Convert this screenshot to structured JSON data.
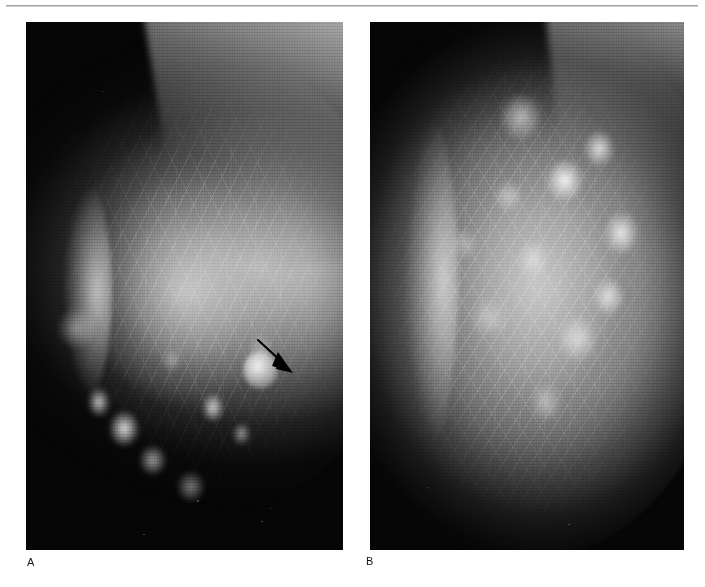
{
  "figure": {
    "kind": "radiology-figure",
    "modality": "mammogram",
    "panel_count": 2,
    "running_head_remnant": "",
    "background_color": "#ffffff",
    "rule_color": "#8f8f8f"
  },
  "panels": [
    {
      "letter": "A",
      "name": "panel-a",
      "view": "mediolateral oblique",
      "background_color": "#000000",
      "annotation": {
        "type": "arrow",
        "color": "#000000",
        "direction": "down-right",
        "tail_x": 262,
        "tail_y": 344,
        "head_x": 288,
        "head_y": 370
      }
    },
    {
      "letter": "B",
      "name": "panel-b",
      "view": "craniocaudal",
      "background_color": "#000000",
      "annotation": null
    }
  ],
  "labels": {
    "panel_a": "A",
    "panel_b": "B"
  }
}
